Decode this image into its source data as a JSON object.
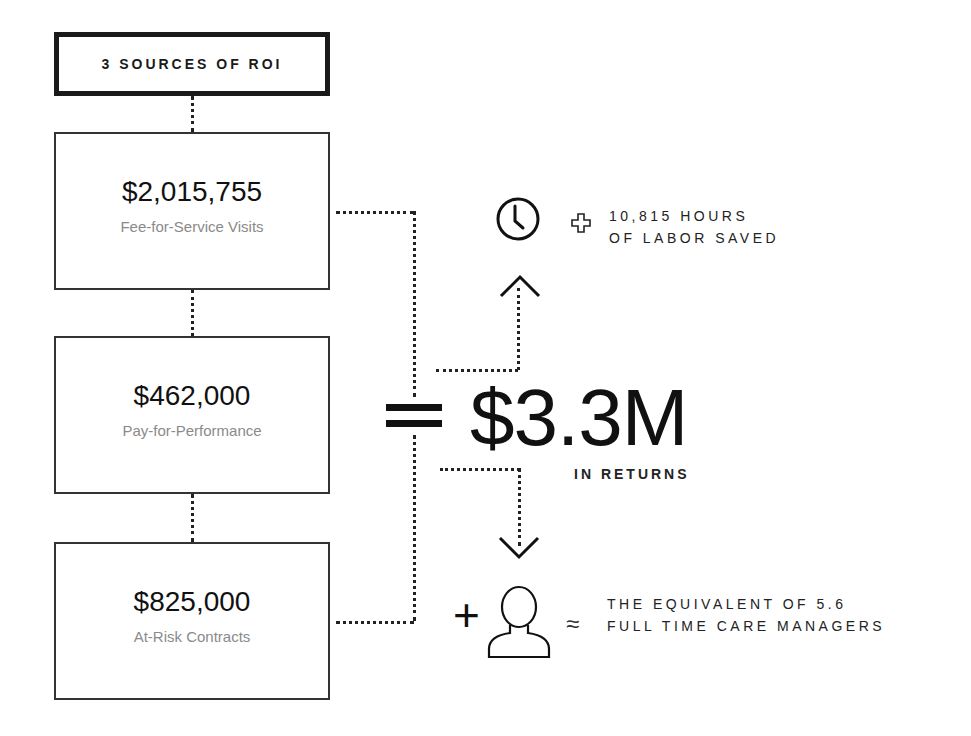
{
  "header": {
    "title": "3 SOURCES OF ROI"
  },
  "sources": [
    {
      "amount": "$2,015,755",
      "label": "Fee-for-Service Visits"
    },
    {
      "amount": "$462,000",
      "label": "Pay-for-Performance"
    },
    {
      "amount": "$825,000",
      "label": "At-Risk Contracts"
    }
  ],
  "total": {
    "operator": "=",
    "value": "$3.3M",
    "caption": "IN RETURNS"
  },
  "benefits": [
    {
      "icon": "clock-icon",
      "connector": "plus-outline-icon",
      "line1": "10,815 HOURS",
      "line2": "OF LABOR SAVED"
    },
    {
      "icon": "person-icon",
      "connector": "approx-icon",
      "prefix": "+",
      "line1": "THE EQUIVALENT OF 5.6",
      "line2": "FULL TIME CARE MANAGERS"
    }
  ],
  "colors": {
    "ink": "#111111",
    "label_gray": "#8a8a8a",
    "background": "#ffffff"
  }
}
